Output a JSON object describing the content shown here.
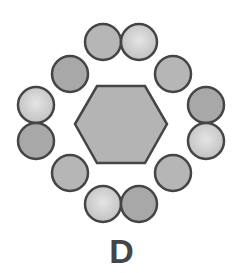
{
  "label": "D",
  "colors": {
    "stroke": "#454545",
    "hexagon_fill": "#b4b4b4",
    "medium_fill": "#b6b6b6",
    "dark_fill": "#a8a8a8",
    "light_center": "#e4e4e4",
    "light_edge": "#c2c2c2"
  },
  "hexagon": {
    "points": "75,124 97,86 145,86 167,124 145,163 97,163"
  },
  "circles": [
    {
      "name": "top-left",
      "cx": 103,
      "cy": 42,
      "shade": "medium"
    },
    {
      "name": "top-right",
      "cx": 139,
      "cy": 42,
      "shade": "light"
    },
    {
      "name": "upper-left",
      "cx": 70,
      "cy": 74,
      "shade": "dark"
    },
    {
      "name": "upper-right",
      "cx": 173,
      "cy": 74,
      "shade": "medium"
    },
    {
      "name": "left-top",
      "cx": 36,
      "cy": 105,
      "shade": "light"
    },
    {
      "name": "left-bottom",
      "cx": 36,
      "cy": 141,
      "shade": "dark"
    },
    {
      "name": "right-top",
      "cx": 206,
      "cy": 105,
      "shade": "dark"
    },
    {
      "name": "right-bottom",
      "cx": 206,
      "cy": 141,
      "shade": "light"
    },
    {
      "name": "lower-left",
      "cx": 70,
      "cy": 173,
      "shade": "medium"
    },
    {
      "name": "lower-right",
      "cx": 173,
      "cy": 173,
      "shade": "medium"
    },
    {
      "name": "bottom-left",
      "cx": 103,
      "cy": 204,
      "shade": "light"
    },
    {
      "name": "bottom-right",
      "cx": 139,
      "cy": 204,
      "shade": "dark"
    }
  ],
  "circle_radius": 18
}
